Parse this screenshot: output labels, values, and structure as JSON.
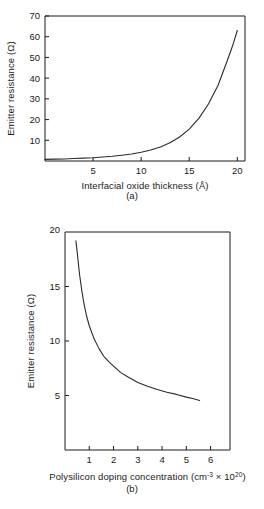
{
  "figure": {
    "panel_a_caption": "(a)",
    "panel_b_caption": "(b)"
  },
  "chart_data": [
    {
      "id": "panel-a",
      "type": "line",
      "title": "",
      "xlabel": "Interfacial oxide thickness (Å)",
      "ylabel": "Emitter resistance (Ω)",
      "xlim": [
        0,
        20.8
      ],
      "ylim": [
        0,
        70
      ],
      "xticks": [
        5,
        10,
        15,
        20
      ],
      "xtick_labels": [
        "5",
        "10",
        "15",
        "20"
      ],
      "yticks": [
        10,
        20,
        30,
        40,
        50,
        60,
        70
      ],
      "ytick_labels": [
        "10",
        "20",
        "30",
        "40",
        "50",
        "60",
        "70"
      ],
      "grid": false,
      "legend": "none",
      "x": [
        0.0,
        1.0,
        2.0,
        3.0,
        4.0,
        5.0,
        6.0,
        7.0,
        8.0,
        9.0,
        10.0,
        11.0,
        12.0,
        13.0,
        14.0,
        15.0,
        16.0,
        17.0,
        18.0,
        19.0,
        19.5,
        20.0
      ],
      "values": [
        0.8,
        0.9,
        1.0,
        1.2,
        1.4,
        1.6,
        1.9,
        2.3,
        2.8,
        3.4,
        4.2,
        5.3,
        6.8,
        8.8,
        11.6,
        15.4,
        20.6,
        27.5,
        36.6,
        49.0,
        55.5,
        63.0
      ]
    },
    {
      "id": "panel-b",
      "type": "line",
      "title": "",
      "xlabel_parts": {
        "text": "Polysilicon doping concentration (cm",
        "sup1": "-3",
        "mid": " × 10",
        "sup2": "20",
        "tail": ")"
      },
      "xlabel": "Polysilicon doping concentration (cm-3 × 1020)",
      "ylabel": "Emitter resistance (Ω)",
      "xlim": [
        0,
        6.8
      ],
      "ylim": [
        0,
        20
      ],
      "xticks": [
        1,
        2,
        3,
        4,
        5,
        6
      ],
      "xtick_labels": [
        "1",
        "2",
        "3",
        "4",
        "5",
        "6"
      ],
      "yticks": [
        5,
        10,
        15,
        20
      ],
      "ytick_labels": [
        "5",
        "10",
        "15",
        "20"
      ],
      "grid": false,
      "legend": "none",
      "x": [
        0.45,
        0.5,
        0.6,
        0.7,
        0.8,
        0.9,
        1.0,
        1.2,
        1.4,
        1.6,
        1.8,
        2.0,
        2.3,
        2.6,
        3.0,
        3.4,
        3.8,
        4.2,
        4.6,
        5.0,
        5.3,
        5.55
      ],
      "values": [
        19.2,
        18.2,
        16.1,
        14.5,
        13.2,
        12.2,
        11.4,
        10.2,
        9.3,
        8.6,
        8.1,
        7.7,
        7.1,
        6.7,
        6.2,
        5.85,
        5.55,
        5.3,
        5.1,
        4.85,
        4.7,
        4.55
      ]
    }
  ]
}
